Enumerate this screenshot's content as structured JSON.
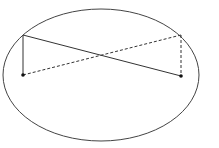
{
  "diagram": {
    "background": "#ffffff",
    "stroke_color": "#333333",
    "ellipse": {
      "cx": 101,
      "cy": 75,
      "rx": 98,
      "ry": 66
    },
    "points": [
      {
        "id": "top-left",
        "x": 23,
        "y": 35,
        "dot": false
      },
      {
        "id": "bottom-left",
        "x": 23,
        "y": 75,
        "dot": true
      },
      {
        "id": "top-right",
        "x": 181,
        "y": 35,
        "dot": false
      },
      {
        "id": "bottom-right",
        "x": 181,
        "y": 76,
        "dot": true
      }
    ],
    "solid_segments": [
      {
        "from": "top-left",
        "to": "bottom-right"
      },
      {
        "from": "top-left",
        "to": "bottom-left"
      }
    ],
    "dashed_segments": [
      {
        "from": "bottom-left",
        "to": "top-right"
      },
      {
        "from": "top-right",
        "to": "bottom-right"
      }
    ]
  }
}
